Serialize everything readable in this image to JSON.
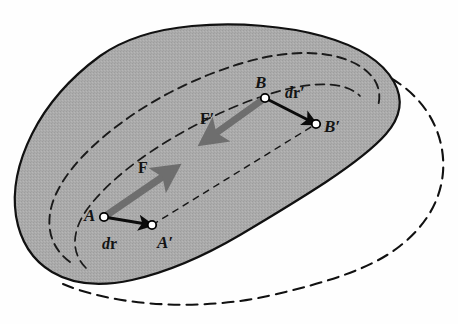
{
  "figure": {
    "domain": "diagram",
    "background_color": "#fefefe"
  },
  "body": {
    "name": "deformable-body",
    "fill_color": "#a9a9a9",
    "outline_color": "#111111",
    "outline_width": 2.0,
    "deformed_outline_color": "#111111",
    "deformed_outline_style": "dashed",
    "deformed_dash_pattern": "11,7"
  },
  "contours": {
    "inner_loop_1_style": "dashed",
    "inner_loop_2_style": "dashed",
    "inner_dash_pattern": "9,6",
    "inner_color": "#1a1a1a"
  },
  "points": [
    {
      "id": "A",
      "label": "A",
      "x": 104,
      "y": 217,
      "label_x": 84,
      "label_y": 207
    },
    {
      "id": "Ap",
      "label": "A′",
      "x": 152,
      "y": 225,
      "label_x": 157,
      "label_y": 234
    },
    {
      "id": "B",
      "label": "B",
      "x": 265,
      "y": 98,
      "label_x": 255,
      "label_y": 74
    },
    {
      "id": "Bp",
      "label": "B′",
      "x": 316,
      "y": 124,
      "label_x": 324,
      "label_y": 118
    }
  ],
  "vectors": [
    {
      "id": "F",
      "label": "F",
      "kind": "force",
      "color": "#6e6e6e",
      "from": "A",
      "to_x": 172,
      "to_y": 170,
      "label_x": 138,
      "label_y": 160,
      "width": 7,
      "description": "internal force on particle A directed toward B"
    },
    {
      "id": "Fp",
      "label": "F′",
      "kind": "force",
      "color": "#6e6e6e",
      "from": "B",
      "to_x": 207,
      "to_y": 140,
      "label_x": 200,
      "label_y": 111,
      "width": 7,
      "description": "reaction force on particle B directed toward A"
    },
    {
      "id": "dr",
      "label_d": "d",
      "label_r": "r",
      "label_prime": "",
      "kind": "displacement",
      "color": "#0b0b0b",
      "from": "A",
      "to": "Ap",
      "label_x": 102,
      "label_y": 236,
      "width": 3,
      "description": "infinitesimal displacement of particle A"
    },
    {
      "id": "drp",
      "label_d": "d",
      "label_r": "r",
      "label_prime": "′",
      "kind": "displacement",
      "color": "#0b0b0b",
      "from": "B",
      "to": "Bp",
      "label_x": 285,
      "label_y": 85,
      "width": 3,
      "description": "infinitesimal displacement of particle B"
    }
  ],
  "connector_lines": [
    {
      "id": "AB",
      "from": "A",
      "to": "B",
      "style": "solid_hidden",
      "description": "line joining original particle positions A and B"
    },
    {
      "id": "ApBp",
      "from": "Ap",
      "to": "Bp",
      "style": "dashed",
      "dash_pattern": "7,5",
      "color": "#151515",
      "width": 1.4,
      "description": "line joining displaced particle positions A-prime and B-prime"
    }
  ],
  "markers": {
    "node_radius": 4.2,
    "node_fill": "#ffffff",
    "node_stroke": "#000000",
    "node_stroke_width": 1.8
  }
}
